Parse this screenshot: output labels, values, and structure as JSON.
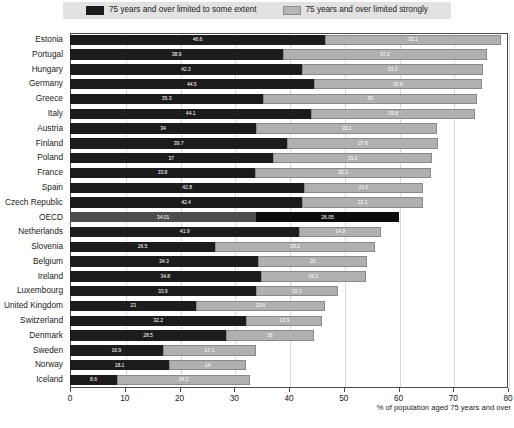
{
  "legend": {
    "entries": [
      {
        "label": "75 years and over limited to some extent",
        "swatch": "dark-square-icon",
        "color": "#1c1c1c"
      },
      {
        "label": "75 years and over limited strongly",
        "swatch": "light-square-icon",
        "color": "#b0b0b0"
      }
    ]
  },
  "axis": {
    "x_title": "% of population aged 75 years and over",
    "ticks": [
      "0",
      "10",
      "20",
      "30",
      "40",
      "50",
      "60",
      "70",
      "80"
    ]
  },
  "chart_data": {
    "type": "bar",
    "orientation": "horizontal",
    "stacked": true,
    "title": "",
    "xlabel": "% of population aged 75 years and over",
    "ylabel": "",
    "xlim": [
      0,
      80
    ],
    "xticks": [
      0,
      10,
      20,
      30,
      40,
      50,
      60,
      70,
      80
    ],
    "grid": true,
    "legend_position": "top",
    "categories": [
      "Estonia",
      "Portugal",
      "Hungary",
      "Germany",
      "Greece",
      "Italy",
      "Austria",
      "Finland",
      "Poland",
      "France",
      "Spain",
      "Czech Republic",
      "OECD",
      "Netherlands",
      "Slovenia",
      "Belgium",
      "Ireland",
      "Luxembourg",
      "United Kingdom",
      "Switzerland",
      "Denmark",
      "Sweden",
      "Norway",
      "Iceland"
    ],
    "series": [
      {
        "name": "75 years and over limited to some extent",
        "color": "#1c1c1c",
        "values": [
          46.6,
          38.9,
          42.3,
          44.5,
          35.3,
          44.1,
          34,
          39.7,
          37,
          33.8,
          42.8,
          42.4,
          34.01,
          41.9,
          26.5,
          34.3,
          34.8,
          33.9,
          23,
          32.2,
          28.5,
          16.9,
          18.1,
          8.6
        ]
      },
      {
        "name": "75 years and over limited strongly",
        "color": "#b0b0b0",
        "values": [
          32.1,
          37.2,
          33.2,
          30.8,
          39,
          29.8,
          33.1,
          27.6,
          29.2,
          32.2,
          21.6,
          22.1,
          26.05,
          14.9,
          29.2,
          20,
          19.2,
          15.1,
          23.6,
          13.9,
          16,
          17.1,
          14,
          24.2
        ]
      }
    ],
    "totals": [
      78.7,
      76.1,
      75.5,
      75.3,
      74.3,
      73.9,
      67.1,
      67.3,
      66.2,
      66.0,
      64.4,
      64.5,
      60.06,
      56.8,
      55.7,
      54.3,
      54.0,
      49.0,
      46.6,
      46.1,
      44.5,
      34.0,
      32.1,
      32.8
    ],
    "highlight_category": "OECD"
  }
}
